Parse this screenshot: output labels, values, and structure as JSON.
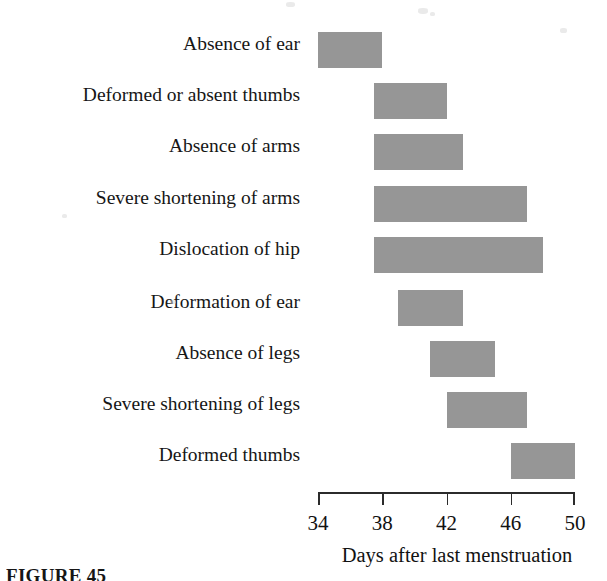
{
  "figure": {
    "caption": "FIGURE 45",
    "xlabel": "Days after last menstruation"
  },
  "colors": {
    "bar_fill": "#969696",
    "axis": "#2b2b2b",
    "text": "#161616",
    "background": "#ffffff"
  },
  "axis": {
    "ticks": [
      {
        "label": "34",
        "value": 34
      },
      {
        "label": "38",
        "value": 38
      },
      {
        "label": "42",
        "value": 42
      },
      {
        "label": "46",
        "value": 46
      },
      {
        "label": "50",
        "value": 50
      }
    ]
  },
  "chart_data": {
    "type": "bar",
    "orientation": "horizontal",
    "subtype": "range-bar",
    "title": "",
    "xlabel": "Days after last menstruation",
    "ylabel": "",
    "xlim": [
      34,
      50
    ],
    "xticks": [
      34,
      38,
      42,
      46,
      50
    ],
    "grid": false,
    "legend": null,
    "bar_color": "#969696",
    "categories": [
      "Absence of ear",
      "Deformed or absent thumbs",
      "Absence of arms",
      "Severe shortening of arms",
      "Dislocation of hip",
      "Deformation of ear",
      "Absence of legs",
      "Severe shortening of legs",
      "Deformed thumbs"
    ],
    "ranges": [
      {
        "category": "Absence of ear",
        "start": 34.0,
        "end": 38.0
      },
      {
        "category": "Deformed or absent thumbs",
        "start": 37.5,
        "end": 42.0
      },
      {
        "category": "Absence of arms",
        "start": 37.5,
        "end": 43.0
      },
      {
        "category": "Severe shortening of arms",
        "start": 37.5,
        "end": 47.0
      },
      {
        "category": "Dislocation of hip",
        "start": 37.5,
        "end": 48.0
      },
      {
        "category": "Deformation of ear",
        "start": 39.0,
        "end": 43.0
      },
      {
        "category": "Absence of legs",
        "start": 41.0,
        "end": 45.0
      },
      {
        "category": "Severe shortening of legs",
        "start": 42.0,
        "end": 47.0
      },
      {
        "category": "Deformed thumbs",
        "start": 46.0,
        "end": 50.0
      }
    ]
  }
}
